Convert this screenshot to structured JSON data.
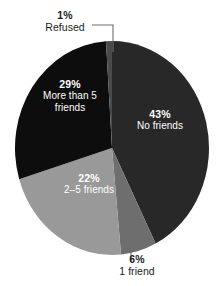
{
  "chart_data": {
    "type": "pie",
    "title": "",
    "subtitle": "",
    "xlabel": "",
    "ylabel": "",
    "legend_position": "none",
    "grid": false,
    "units": "percent",
    "total": 101,
    "categories": [
      "No friends",
      "1 friend",
      "2–5 friends",
      "More than 5 friends",
      "Refused"
    ],
    "values": [
      43,
      6,
      22,
      29,
      1
    ],
    "slices": [
      {
        "id": "no-friends",
        "label": "No friends",
        "percent_text": "43%",
        "value": 43,
        "color": "#282828",
        "label_placement": "inside",
        "label_color": "#ffffff"
      },
      {
        "id": "one-friend",
        "label": "1 friend",
        "percent_text": "6%",
        "value": 6,
        "color": "#6e6e6e",
        "label_placement": "outside",
        "label_color": "#1c1c1c",
        "leader_line": true
      },
      {
        "id": "two-to-five-friends",
        "label": "2–5 friends",
        "percent_text": "22%",
        "value": 22,
        "color": "#999999",
        "label_placement": "inside",
        "label_color": "#ffffff"
      },
      {
        "id": "more-than-five-friends",
        "label_line1": "More than 5",
        "label_line2": "friends",
        "label": "More than 5 friends",
        "percent_text": "29%",
        "value": 29,
        "color": "#0d0d0d",
        "label_placement": "inside",
        "label_color": "#ffffff"
      },
      {
        "id": "refused",
        "label": "Refused",
        "percent_text": "1%",
        "value": 1,
        "color": "#4a4a4a",
        "label_placement": "outside",
        "label_color": "#1c1c1c",
        "leader_line": true
      }
    ],
    "background_color": "#ffffff",
    "start_angle_deg": 0,
    "direction": "clockwise"
  },
  "labels": {
    "refused": {
      "pct": "1%",
      "name": "Refused"
    },
    "no_friends": {
      "pct": "43%",
      "name": "No friends"
    },
    "more_than_5": {
      "pct": "29%",
      "name_line1": "More than 5",
      "name_line2": "friends"
    },
    "two_to_five": {
      "pct": "22%",
      "name": "2–5 friends"
    },
    "one_friend": {
      "pct": "6%",
      "name": "1 friend"
    }
  }
}
